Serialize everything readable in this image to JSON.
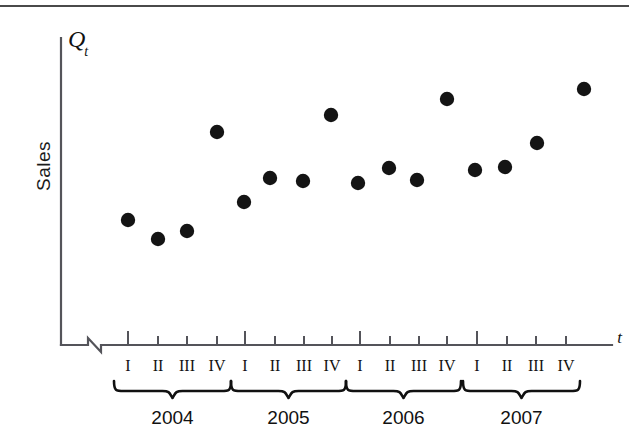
{
  "figure": {
    "y_axis_symbol": "Q",
    "y_axis_subscript": "t",
    "y_axis_label": "Sales",
    "x_axis_symbol": "t",
    "top_rule_color": "#4a4a4a",
    "dot_color": "#141414",
    "axis_color": "#54545a"
  },
  "chart_data": {
    "type": "scatter",
    "title": "",
    "xlabel": "t",
    "ylabel": "Sales",
    "y_axis_symbol": "Q_t",
    "grid": false,
    "legend": "none",
    "axis_break": true,
    "ylim": [
      0,
      1
    ],
    "groups": [
      {
        "year": "2004",
        "quarters": [
          "I",
          "II",
          "III",
          "IV"
        ]
      },
      {
        "year": "2005",
        "quarters": [
          "I",
          "II",
          "III",
          "IV"
        ]
      },
      {
        "year": "2006",
        "quarters": [
          "I",
          "II",
          "III",
          "IV"
        ]
      },
      {
        "year": "2007",
        "quarters": [
          "I",
          "II",
          "III",
          "IV"
        ]
      }
    ],
    "categories": [
      "2004 I",
      "2004 II",
      "2004 III",
      "2004 IV",
      "2005 I",
      "2005 II",
      "2005 III",
      "2005 IV",
      "2006 I",
      "2006 II",
      "2006 III",
      "2006 IV",
      "2007 I",
      "2007 II",
      "2007 III",
      "2007 IV"
    ],
    "values": [
      0.41,
      0.35,
      0.38,
      0.69,
      0.47,
      0.55,
      0.54,
      0.76,
      0.53,
      0.58,
      0.54,
      0.84,
      0.57,
      0.58,
      0.66,
      0.87
    ],
    "points_px": [
      {
        "x": 128,
        "y": 220
      },
      {
        "x": 158,
        "y": 239
      },
      {
        "x": 187,
        "y": 231
      },
      {
        "x": 217,
        "y": 132
      },
      {
        "x": 244,
        "y": 202
      },
      {
        "x": 270,
        "y": 178
      },
      {
        "x": 303,
        "y": 181
      },
      {
        "x": 331,
        "y": 115
      },
      {
        "x": 358,
        "y": 183
      },
      {
        "x": 389,
        "y": 168
      },
      {
        "x": 417,
        "y": 180
      },
      {
        "x": 447,
        "y": 99
      },
      {
        "x": 475,
        "y": 170
      },
      {
        "x": 505,
        "y": 167
      },
      {
        "x": 537,
        "y": 143
      },
      {
        "x": 584,
        "y": 89
      }
    ],
    "tick_px": [
      128,
      158,
      187,
      217,
      245,
      275,
      304,
      332,
      360,
      390,
      419,
      447,
      477,
      507,
      536,
      566
    ]
  }
}
